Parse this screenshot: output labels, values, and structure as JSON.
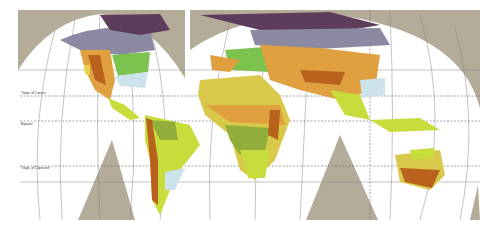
{
  "map": {
    "title": "",
    "projection": "interrupted world map",
    "lines": {
      "tropic_of_cancer": "Tropic of Cancer",
      "equator": "Equator",
      "tropic_of_capricorn": "Tropic of Capricorn"
    },
    "colors": {
      "ocean": "#ffffff",
      "frame_gray": "#b5ab99",
      "tundra_purple": "#5e3d5c",
      "taiga_gray": "#8c8aa3",
      "temperate_green": "#7cc24e",
      "pale_blue": "#cde3ec",
      "desert_yellow": "#d9c94a",
      "steppe_orange": "#e0a040",
      "mountain_brown": "#b8621e",
      "savanna_lime": "#c8dc3c",
      "rainforest_olive": "#8fae3a"
    }
  }
}
